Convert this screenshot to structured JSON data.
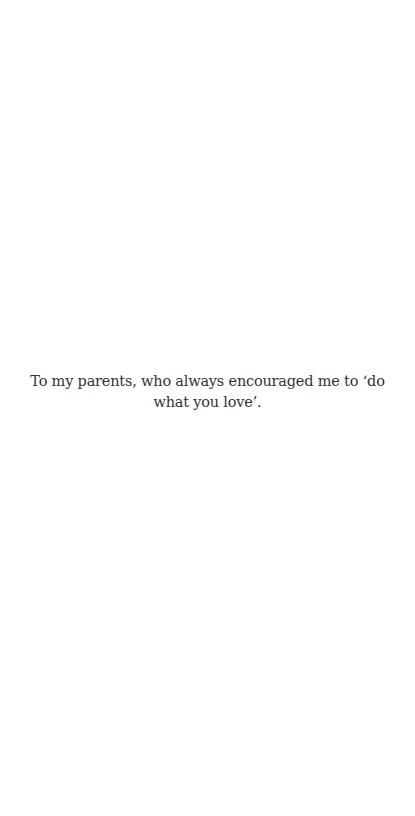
{
  "page": {
    "background_color": "#ffffff",
    "text_color": "#333333"
  },
  "dedication": {
    "text": "To my parents, who always encouraged me to ‘do what you love’."
  }
}
